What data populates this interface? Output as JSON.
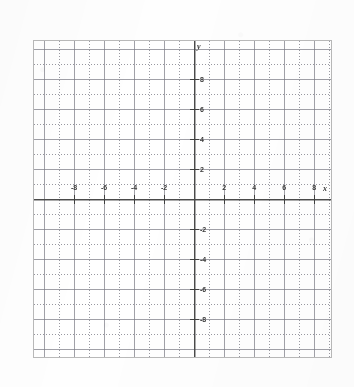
{
  "figure": {
    "kind": "cartesian-coordinate-grid",
    "axis_labels": {
      "x": "x",
      "y": "y"
    }
  },
  "chart_data": {
    "type": "scatter",
    "title": "",
    "subtitle": "",
    "xlabel": "x",
    "ylabel": "y",
    "xlim": [
      -9.9,
      9.3
    ],
    "ylim": [
      -10.6,
      10.5
    ],
    "xticks": [
      -8,
      -6,
      -4,
      -2,
      2,
      4,
      6,
      8
    ],
    "yticks": [
      8,
      6,
      4,
      2,
      -2,
      -4,
      -6,
      -8
    ],
    "xtick_labels": [
      "-8",
      "-6",
      "-4",
      "-2",
      "2",
      "4",
      "6",
      "8"
    ],
    "ytick_labels": [
      "8",
      "6",
      "4",
      "2",
      "-2",
      "-4",
      "-6",
      "-8"
    ],
    "tick_interval": 2,
    "minor_grid_interval": 1,
    "grid": true,
    "grid_minor_style": "dotted",
    "grid_major_style": "solid",
    "legend": null,
    "legend_position": "none",
    "series": [],
    "values": [],
    "x": [],
    "annotations": [],
    "origin_label": ""
  },
  "grid": {
    "x_labels": [
      {
        "text": "-8",
        "value": -8
      },
      {
        "text": "-6",
        "value": -6
      },
      {
        "text": "-4",
        "value": -4
      },
      {
        "text": "-2",
        "value": -2
      },
      {
        "text": "2",
        "value": 2
      },
      {
        "text": "4",
        "value": 4
      },
      {
        "text": "6",
        "value": 6
      },
      {
        "text": "8",
        "value": 8
      }
    ],
    "y_labels": [
      {
        "text": "8",
        "value": 8
      },
      {
        "text": "6",
        "value": 6
      },
      {
        "text": "4",
        "value": 4
      },
      {
        "text": "2",
        "value": 2
      },
      {
        "text": "-2",
        "value": -2
      },
      {
        "text": "-4",
        "value": -4
      },
      {
        "text": "-6",
        "value": -6
      },
      {
        "text": "-8",
        "value": -8
      }
    ]
  },
  "colors": {
    "page_background": "#ffffff",
    "plate_background": "#ffffff",
    "plate_border": "#b9b9b9",
    "grid_minor": "#8c8c96",
    "grid_major": "#7d7d87",
    "axis": "#4a4a4a",
    "tick": "#3f3f3f",
    "label_text": "#3a3a3a"
  }
}
